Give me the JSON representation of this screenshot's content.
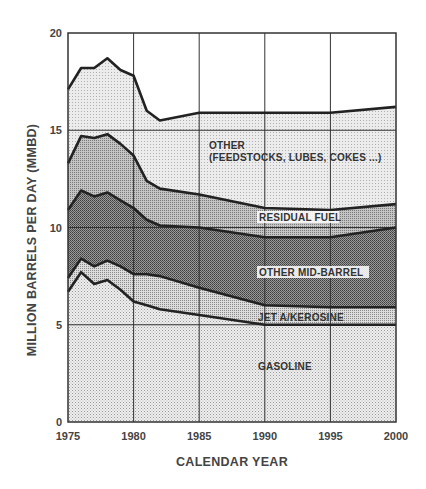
{
  "chart_data": {
    "type": "area",
    "stacked": true,
    "title": "",
    "xlabel": "CALENDAR YEAR",
    "ylabel": "MILLION BARRELS PER DAY (MMBD)",
    "xlim": [
      1975,
      2000
    ],
    "ylim": [
      0,
      20
    ],
    "xticks": [
      1975,
      1980,
      1985,
      1990,
      1995,
      2000
    ],
    "yticks": [
      0,
      5,
      10,
      15,
      20
    ],
    "grid": true,
    "legend": "inline labels",
    "x": [
      1975,
      1976,
      1977,
      1978,
      1979,
      1980,
      1981,
      1982,
      1985,
      1990,
      1995,
      2000
    ],
    "cumulative_tops": {
      "gasoline": [
        6.7,
        7.7,
        7.1,
        7.3,
        6.8,
        6.2,
        6.0,
        5.8,
        5.5,
        5.0,
        5.0,
        5.0
      ],
      "jet_a_kerosine": [
        7.4,
        8.4,
        8.0,
        8.3,
        8.0,
        7.6,
        7.6,
        7.5,
        6.9,
        6.0,
        5.9,
        5.9
      ],
      "other_mid_barrel": [
        10.9,
        11.9,
        11.6,
        11.8,
        11.4,
        11.0,
        10.4,
        10.1,
        10.0,
        9.5,
        9.5,
        10.0
      ],
      "residual_fuel": [
        13.3,
        14.7,
        14.6,
        14.8,
        14.3,
        13.7,
        12.4,
        12.0,
        11.7,
        11.0,
        10.9,
        11.2
      ],
      "other": [
        17.1,
        18.2,
        18.2,
        18.7,
        18.1,
        17.8,
        16.0,
        15.5,
        15.9,
        15.9,
        15.9,
        16.2
      ]
    },
    "series": [
      {
        "name": "GASOLINE",
        "values": [
          6.7,
          7.7,
          7.1,
          7.3,
          6.8,
          6.2,
          6.0,
          5.8,
          5.5,
          5.0,
          5.0,
          5.0
        ]
      },
      {
        "name": "JET A/KEROSINE",
        "values": [
          0.7,
          0.7,
          0.9,
          1.0,
          1.2,
          1.4,
          1.6,
          1.7,
          1.4,
          1.0,
          0.9,
          0.9
        ]
      },
      {
        "name": "OTHER MID-BARREL",
        "values": [
          3.5,
          3.5,
          3.6,
          3.5,
          3.4,
          3.4,
          2.8,
          2.6,
          3.1,
          3.5,
          3.6,
          4.1
        ]
      },
      {
        "name": "RESIDUAL FUEL",
        "values": [
          2.4,
          2.8,
          3.0,
          3.0,
          2.9,
          2.7,
          2.0,
          1.9,
          1.7,
          1.5,
          1.4,
          1.2
        ]
      },
      {
        "name": "OTHER (FEEDSTOCKS, LUBES, COKES ...)",
        "values": [
          3.8,
          3.5,
          3.6,
          3.9,
          3.8,
          4.1,
          3.6,
          3.5,
          4.2,
          4.9,
          5.0,
          5.0
        ]
      }
    ],
    "labels": {
      "other_line1": "OTHER",
      "other_line2": "(FEEDSTOCKS, LUBES, COKES ...)",
      "residual_fuel": "RESIDUAL FUEL",
      "other_mid_barrel": "OTHER MID-BARREL",
      "jet_a_kerosine": "JET A/KEROSINE",
      "gasoline": "GASOLINE"
    },
    "fill_colors": {
      "gasoline": "#e2e2e2",
      "jet_a_kerosine": "#c8c8c8",
      "other_mid_barrel": "#7a7a7a",
      "residual_fuel": "#a8a8a8",
      "other": "#dedede"
    }
  }
}
